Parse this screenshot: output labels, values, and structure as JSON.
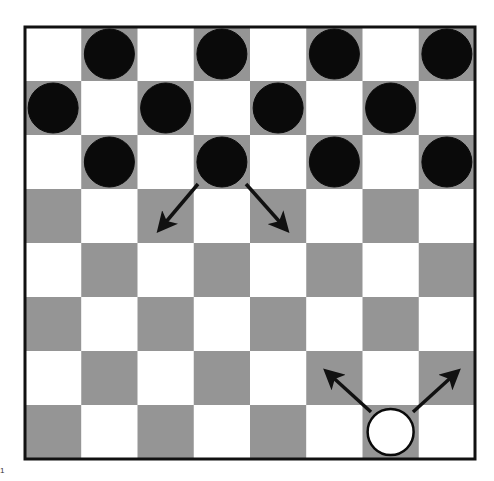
{
  "board": {
    "rows": 8,
    "cols": 8,
    "left": 25,
    "top": 27,
    "width": 450,
    "height": 432,
    "light_color": "#ffffff",
    "dark_color": "#959595",
    "border_color": "#111111",
    "dark_parity": "odd"
  },
  "pieces": [
    {
      "color": "black",
      "row": 0,
      "col": 1
    },
    {
      "color": "black",
      "row": 0,
      "col": 3
    },
    {
      "color": "black",
      "row": 0,
      "col": 5
    },
    {
      "color": "black",
      "row": 0,
      "col": 7
    },
    {
      "color": "black",
      "row": 1,
      "col": 0
    },
    {
      "color": "black",
      "row": 1,
      "col": 2
    },
    {
      "color": "black",
      "row": 1,
      "col": 4
    },
    {
      "color": "black",
      "row": 1,
      "col": 6
    },
    {
      "color": "black",
      "row": 2,
      "col": 1
    },
    {
      "color": "black",
      "row": 2,
      "col": 3
    },
    {
      "color": "black",
      "row": 2,
      "col": 5
    },
    {
      "color": "black",
      "row": 2,
      "col": 7
    },
    {
      "color": "white",
      "row": 7,
      "col": 6
    }
  ],
  "move_arrows": [
    {
      "from": {
        "row": 2,
        "col": 3
      },
      "to": {
        "row": 3,
        "col": 2
      },
      "x1": 198,
      "y1": 184,
      "x2": 160,
      "y2": 229
    },
    {
      "from": {
        "row": 2,
        "col": 3
      },
      "to": {
        "row": 3,
        "col": 4
      },
      "x1": 246,
      "y1": 184,
      "x2": 286,
      "y2": 229
    },
    {
      "from": {
        "row": 7,
        "col": 6
      },
      "to": {
        "row": 6,
        "col": 5
      },
      "x1": 371,
      "y1": 412,
      "x2": 327,
      "y2": 372
    },
    {
      "from": {
        "row": 7,
        "col": 6
      },
      "to": {
        "row": 6,
        "col": 7
      },
      "x1": 413,
      "y1": 412,
      "x2": 457,
      "y2": 372
    }
  ],
  "figure_label": "1"
}
